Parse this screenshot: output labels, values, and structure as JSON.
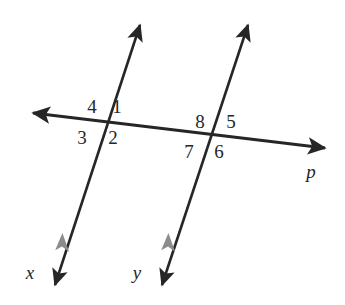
{
  "figure": {
    "kind": "parallel-lines-cut-by-transversal",
    "background_color": "#ffffff",
    "stroke_color": "#262626",
    "tick_mark_color": "#8c8c8c",
    "text_color": "#262626"
  },
  "lines": [
    {
      "id": "line-x",
      "label": "x",
      "label_x": 30,
      "label_y": 272,
      "x1": 140,
      "y1": 25,
      "x2": 55,
      "y2": 285,
      "arrow_start": true,
      "arrow_end": true,
      "parallel_tick": {
        "x": 62,
        "y": 243
      }
    },
    {
      "id": "line-y",
      "label": "y",
      "label_x": 137,
      "label_y": 272,
      "x1": 248,
      "y1": 25,
      "x2": 162,
      "y2": 285,
      "arrow_start": true,
      "arrow_end": true,
      "parallel_tick": {
        "x": 168,
        "y": 243
      }
    },
    {
      "id": "line-p",
      "label": "p",
      "label_x": 311,
      "label_y": 171,
      "x1": 33,
      "y1": 113,
      "x2": 325,
      "y2": 148,
      "arrow_start": true,
      "arrow_end": true,
      "parallel_tick": null
    }
  ],
  "intersections": [
    {
      "id": "intersection-left",
      "x": 103,
      "y": 122
    },
    {
      "id": "intersection-right",
      "x": 211,
      "y": 137
    }
  ],
  "angle_labels": [
    {
      "id": "angle-4",
      "text": "4",
      "x": 92,
      "y": 106
    },
    {
      "id": "angle-1",
      "text": "1",
      "x": 117,
      "y": 106
    },
    {
      "id": "angle-3",
      "text": "3",
      "x": 82,
      "y": 137
    },
    {
      "id": "angle-2",
      "text": "2",
      "x": 113,
      "y": 137
    },
    {
      "id": "angle-8",
      "text": "8",
      "x": 200,
      "y": 121
    },
    {
      "id": "angle-5",
      "text": "5",
      "x": 231,
      "y": 121
    },
    {
      "id": "angle-7",
      "text": "7",
      "x": 189,
      "y": 151
    },
    {
      "id": "angle-6",
      "text": "6",
      "x": 219,
      "y": 151
    }
  ]
}
